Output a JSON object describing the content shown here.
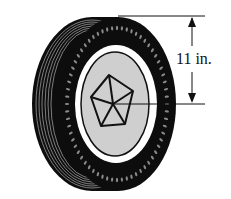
{
  "figure": {
    "dimension_label": "11 in.",
    "dimension_meaning": "radius",
    "colors": {
      "tire": "#0d0d0d",
      "tread_lines": "#9a9a9a",
      "rim_ring": "#ffffff",
      "hub": "#cfcfcf",
      "ink": "#111111",
      "background": "#ffffff"
    }
  }
}
